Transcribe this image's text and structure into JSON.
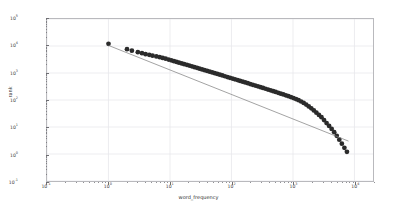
{
  "chart_data": {
    "type": "scatter",
    "title": "",
    "xlabel": "word_frequency",
    "ylabel": "rank",
    "xscale": "log",
    "yscale": "log",
    "xlim": [
      0.1,
      20000
    ],
    "ylim": [
      0.1,
      100000
    ],
    "grid": true,
    "legend": false,
    "xticks": [
      {
        "value": 0.1,
        "label": "10",
        "exp": "-1"
      },
      {
        "value": 1,
        "label": "10",
        "exp": "0"
      },
      {
        "value": 10,
        "label": "10",
        "exp": "1"
      },
      {
        "value": 100,
        "label": "10",
        "exp": "2"
      },
      {
        "value": 1000,
        "label": "10",
        "exp": "3"
      },
      {
        "value": 10000,
        "label": "10",
        "exp": "4"
      }
    ],
    "yticks": [
      {
        "value": 0.1,
        "label": "10",
        "exp": "-1"
      },
      {
        "value": 1,
        "label": "10",
        "exp": "0"
      },
      {
        "value": 10,
        "label": "10",
        "exp": "1"
      },
      {
        "value": 100,
        "label": "10",
        "exp": "2"
      },
      {
        "value": 1000,
        "label": "10",
        "exp": "3"
      },
      {
        "value": 10000,
        "label": "10",
        "exp": "4"
      },
      {
        "value": 100000,
        "label": "10",
        "exp": "5"
      }
    ],
    "series": [
      {
        "name": "observed",
        "type": "scatter",
        "color": "#2b2b2b",
        "marker": "circle",
        "marker_size": 2.4,
        "points": [
          [
            1.0,
            12000
          ],
          [
            2.0,
            7600
          ],
          [
            2.4,
            6700
          ],
          [
            3.0,
            5900
          ],
          [
            3.5,
            5400
          ],
          [
            4.0,
            5000
          ],
          [
            4.6,
            4700
          ],
          [
            5.2,
            4400
          ],
          [
            6.0,
            4100
          ],
          [
            6.8,
            3850
          ],
          [
            7.6,
            3600
          ],
          [
            8.5,
            3400
          ],
          [
            9.5,
            3150
          ],
          [
            10.5,
            2950
          ],
          [
            11.6,
            2750
          ],
          [
            12.8,
            2580
          ],
          [
            14.0,
            2420
          ],
          [
            15.5,
            2270
          ],
          [
            17.0,
            2130
          ],
          [
            18.8,
            2000
          ],
          [
            20.6,
            1880
          ],
          [
            22.7,
            1760
          ],
          [
            25.0,
            1650
          ],
          [
            27.5,
            1550
          ],
          [
            30.2,
            1450
          ],
          [
            33.2,
            1360
          ],
          [
            36.5,
            1275
          ],
          [
            40.2,
            1195
          ],
          [
            44.2,
            1120
          ],
          [
            48.6,
            1050
          ],
          [
            53.4,
            985
          ],
          [
            58.8,
            920
          ],
          [
            64.6,
            865
          ],
          [
            71.0,
            810
          ],
          [
            78.2,
            758
          ],
          [
            86.0,
            710
          ],
          [
            94.5,
            665
          ],
          [
            104,
            622
          ],
          [
            114,
            583
          ],
          [
            126,
            545
          ],
          [
            138,
            510
          ],
          [
            152,
            478
          ],
          [
            167,
            447
          ],
          [
            184,
            418
          ],
          [
            202,
            391
          ],
          [
            222,
            366
          ],
          [
            244,
            342
          ],
          [
            269,
            320
          ],
          [
            296,
            299
          ],
          [
            325,
            279
          ],
          [
            358,
            261
          ],
          [
            393,
            244
          ],
          [
            433,
            228
          ],
          [
            476,
            212
          ],
          [
            523,
            198
          ],
          [
            576,
            185
          ],
          [
            633,
            172
          ],
          [
            696,
            160
          ],
          [
            766,
            149
          ],
          [
            842,
            138
          ],
          [
            926,
            128
          ],
          [
            1019,
            118
          ],
          [
            1120,
            108
          ],
          [
            1232,
            98
          ],
          [
            1355,
            88
          ],
          [
            1491,
            78
          ],
          [
            1640,
            68
          ],
          [
            1804,
            58
          ],
          [
            1984,
            49
          ],
          [
            2183,
            41
          ],
          [
            2401,
            34
          ],
          [
            2641,
            28
          ],
          [
            2905,
            23
          ],
          [
            3196,
            18
          ],
          [
            3515,
            14
          ],
          [
            3867,
            11
          ],
          [
            4254,
            8.5
          ],
          [
            4679,
            6.4
          ],
          [
            5147,
            4.7
          ],
          [
            5662,
            3.4
          ],
          [
            6228,
            2.4
          ],
          [
            6851,
            1.7
          ],
          [
            7536,
            1.2
          ]
        ]
      },
      {
        "name": "power-law fit",
        "type": "line",
        "color": "#7a7a7a",
        "linewidth": 0.7,
        "points": [
          [
            1.0,
            10500
          ],
          [
            8000,
            3.0
          ]
        ]
      }
    ]
  }
}
